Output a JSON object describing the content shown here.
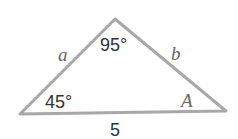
{
  "diagram": {
    "type": "triangle",
    "vertices": {
      "left": {
        "x": 20,
        "y": 114
      },
      "top": {
        "x": 115,
        "y": 19
      },
      "right": {
        "x": 226,
        "y": 111
      }
    },
    "sides": {
      "left_side": "a",
      "right_side": "b",
      "bottom_side": "5"
    },
    "angles": {
      "top": "95°",
      "left": "45°",
      "right": "A"
    },
    "stroke_color": "#a8a8a8"
  }
}
